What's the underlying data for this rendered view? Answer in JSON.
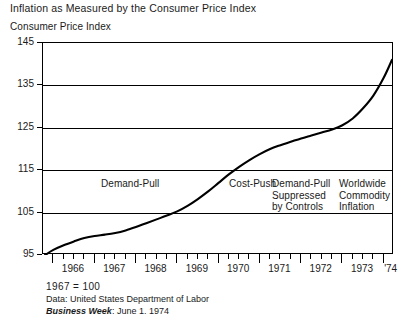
{
  "chart_data": {
    "type": "line",
    "title": "Inflation as Measured by the Consumer Price Index",
    "ylabel": "Consumer Price Index",
    "xlabel": "",
    "ylim": [
      95,
      145
    ],
    "xlim": [
      1965.75,
      1974.25
    ],
    "grid": true,
    "legend": "none",
    "yticks": [
      95,
      105,
      115,
      125,
      135,
      145
    ],
    "ytick_labels": [
      "95",
      "105",
      "115",
      "125",
      "135",
      "145"
    ],
    "xticks": [
      1966,
      1967,
      1968,
      1969,
      1970,
      1971,
      1972,
      1973,
      1974
    ],
    "xtick_labels": [
      "1966",
      "1967",
      "1968",
      "1969",
      "1970",
      "1971",
      "1972",
      "1973",
      "'74"
    ],
    "minor_xticks_per_year": 4,
    "series": [
      {
        "name": "Consumer Price Index",
        "color": "#000000",
        "x": [
          1965.8,
          1966.0,
          1966.25,
          1966.5,
          1966.75,
          1967.0,
          1967.25,
          1967.5,
          1967.75,
          1968.0,
          1968.25,
          1968.5,
          1968.75,
          1969.0,
          1969.25,
          1969.5,
          1969.75,
          1970.0,
          1970.25,
          1970.5,
          1970.75,
          1971.0,
          1971.25,
          1971.5,
          1971.75,
          1972.0,
          1972.25,
          1972.5,
          1972.75,
          1973.0,
          1973.25,
          1973.5,
          1973.75,
          1974.0,
          1974.2
        ],
        "values": [
          95.0,
          96.2,
          97.3,
          98.2,
          99.0,
          99.5,
          99.8,
          100.2,
          100.8,
          101.6,
          102.5,
          103.4,
          104.3,
          105.3,
          106.6,
          108.2,
          110.0,
          112.0,
          114.0,
          115.8,
          117.4,
          118.8,
          120.0,
          120.9,
          121.7,
          122.5,
          123.2,
          123.9,
          124.6,
          125.6,
          127.2,
          129.6,
          132.6,
          136.8,
          141.0
        ]
      }
    ],
    "annotations": [
      {
        "id": "demand-pull",
        "text": "Demand-Pull",
        "x_px": 100,
        "y_px": 177
      },
      {
        "id": "cost-push",
        "text": "Cost-Push",
        "x_px": 228,
        "y_px": 177
      },
      {
        "id": "demand-pull-suppressed",
        "text": "Demand-Pull\nSuppressed\nby Controls",
        "x_px": 271,
        "y_px": 177
      },
      {
        "id": "worldwide-commodity",
        "text": "Worldwide\nCommodity\nInflation",
        "x_px": 338,
        "y_px": 177
      }
    ]
  },
  "footer": {
    "base_year": "1967  =  100",
    "data_source": "Data: United States Department of Labor",
    "publication": "Business Week",
    "publication_date": ": June 1. 1974"
  }
}
